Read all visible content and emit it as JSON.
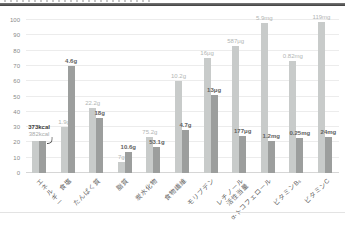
{
  "chart_data": {
    "type": "bar",
    "title": "",
    "legend": "none",
    "grid": true,
    "ylim": [
      0,
      100
    ],
    "yticks": [
      0,
      10,
      20,
      30,
      40,
      50,
      60,
      70,
      80,
      90,
      100
    ],
    "categories": [
      "エネルギー",
      "食塩",
      "たんぱく質",
      "脂質",
      "炭水化物",
      "食物繊維",
      "モリブデン",
      "レチノール\n活性当量",
      "α-トコフェロール",
      "ビタミンB₆",
      "ビタミンC"
    ],
    "series": [
      {
        "name": "series-light",
        "color": "#c8cbca",
        "label_color": "#b2b5b4",
        "values": [
          21,
          30,
          42.5,
          7,
          23.5,
          60,
          75,
          83,
          98,
          73,
          99
        ],
        "labels": [
          "382kcal",
          "1.9g",
          "22.2g",
          "7g",
          "75.2g",
          "10.2g",
          "16μg",
          "587μg",
          "5.9mg",
          "0.82mg",
          "119mg"
        ]
      },
      {
        "name": "series-dark",
        "color": "#9c9e9d",
        "label_color": "#5f6261",
        "values": [
          21,
          70,
          36,
          14,
          17,
          28,
          51,
          24,
          21,
          23,
          23.5
        ],
        "labels": [
          "373kcal",
          "4.6g",
          "18g",
          "10.6g",
          "53.1g",
          "4.7g",
          "13μg",
          "177μg",
          "1.2mg",
          "0.25mg",
          "24mg"
        ]
      }
    ],
    "colors": {
      "grid": "#ececec",
      "zero_line": "#d6d6d6",
      "axis_text": "#8a8a8a",
      "category_text": "#5f5f5f",
      "top_rule": "#3e3e3e",
      "divider": "#e3e3e3"
    }
  }
}
